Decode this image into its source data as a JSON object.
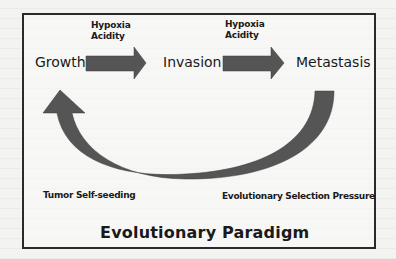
{
  "diagram": {
    "title": "Evolutionary Paradigm",
    "stages": [
      {
        "id": "growth",
        "label": "Growth"
      },
      {
        "id": "invasion",
        "label": "Invasion"
      },
      {
        "id": "metastasis",
        "label": "Metastasis"
      }
    ],
    "transitions": [
      {
        "from": "growth",
        "to": "invasion",
        "conditions": [
          "Hypoxia",
          "Acidity"
        ]
      },
      {
        "from": "invasion",
        "to": "metastasis",
        "conditions": [
          "Hypoxia",
          "Acidity"
        ]
      }
    ],
    "feedback": {
      "from": "metastasis",
      "to": "growth",
      "left_caption": "Tumor Self-seeding",
      "right_caption": "Evolutionary Selection Pressure"
    },
    "colors": {
      "arrow": "#555555",
      "frame": "#2a2a2a",
      "text": "#1a1a1a",
      "background": "#f3f3f1"
    }
  }
}
